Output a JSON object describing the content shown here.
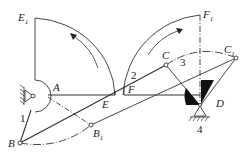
{
  "diagram": {
    "type": "linkage mechanism",
    "points": {
      "A": {
        "label": "A",
        "x": 48,
        "y": 95
      },
      "B": {
        "label": "B",
        "x": 20,
        "y": 143
      },
      "B1": {
        "label": "B",
        "sub": "1",
        "x": 91,
        "y": 125
      },
      "C": {
        "label": "C",
        "x": 166,
        "y": 65
      },
      "C1": {
        "label": "C",
        "sub": "1",
        "x": 236,
        "y": 58
      },
      "D": {
        "label": "D",
        "x": 200,
        "y": 106
      },
      "E": {
        "label": "E",
        "x": 102,
        "y": 104
      },
      "F": {
        "label": "F",
        "x": 126,
        "y": 104
      },
      "E1": {
        "label": "E",
        "sub": "1",
        "x": 35,
        "y": 18
      },
      "F1": {
        "label": "F",
        "sub": "1",
        "x": 200,
        "y": 15
      }
    },
    "link_numbers": [
      "1",
      "2",
      "3",
      "4"
    ],
    "colors": {
      "line": "#333333",
      "fill": "#111111",
      "background": "#ffffff"
    }
  },
  "labels": {
    "E1": "E",
    "E1_sub": "1",
    "F1": "F",
    "F1_sub": "1",
    "A": "A",
    "B": "B",
    "B1": "B",
    "B1_sub": "1",
    "C": "C",
    "C1": "C",
    "C1_sub": "1",
    "D": "D",
    "E": "E",
    "F": "F",
    "n1": "1",
    "n2": "2",
    "n3": "3",
    "n4": "4"
  }
}
